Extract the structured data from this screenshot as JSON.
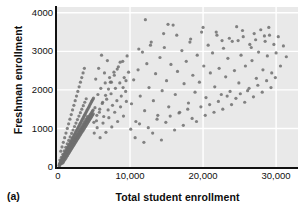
{
  "figure": {
    "panel_label": "(a)",
    "plot_background": "#e9e9e9",
    "gridline_color": "#ffffff",
    "point_color": "#6e6e6e",
    "axis_color": "#111111"
  },
  "chart_data": {
    "type": "scatter",
    "title": "",
    "xlabel": "Total student enrollment",
    "ylabel": "Freshman enrollment",
    "xlim": [
      0,
      33000
    ],
    "ylim": [
      0,
      4150
    ],
    "xticks": [
      0,
      10000,
      20000,
      30000
    ],
    "xticklabels": [
      "0",
      "10,000",
      "20,000",
      "30,000"
    ],
    "yticks": [
      0,
      1000,
      2000,
      3000,
      4000
    ],
    "yticklabels": [
      "0",
      "1000",
      "2000",
      "3000",
      "4000"
    ],
    "grid": true,
    "grid_axis": "both",
    "legend": "none",
    "marker": "dot",
    "marker_size": 1.6,
    "points": [
      [
        280,
        40
      ],
      [
        330,
        60
      ],
      [
        360,
        35
      ],
      [
        410,
        95
      ],
      [
        450,
        70
      ],
      [
        470,
        130
      ],
      [
        520,
        90
      ],
      [
        560,
        150
      ],
      [
        590,
        110
      ],
      [
        610,
        175
      ],
      [
        640,
        130
      ],
      [
        660,
        200
      ],
      [
        700,
        160
      ],
      [
        720,
        95
      ],
      [
        750,
        230
      ],
      [
        780,
        140
      ],
      [
        800,
        260
      ],
      [
        830,
        185
      ],
      [
        860,
        120
      ],
      [
        880,
        290
      ],
      [
        910,
        210
      ],
      [
        940,
        160
      ],
      [
        960,
        320
      ],
      [
        990,
        240
      ],
      [
        1010,
        180
      ],
      [
        1040,
        350
      ],
      [
        1070,
        270
      ],
      [
        1100,
        200
      ],
      [
        1120,
        380
      ],
      [
        1150,
        300
      ],
      [
        1180,
        230
      ],
      [
        1200,
        410
      ],
      [
        1230,
        330
      ],
      [
        1260,
        255
      ],
      [
        1290,
        440
      ],
      [
        1310,
        360
      ],
      [
        1340,
        280
      ],
      [
        1370,
        470
      ],
      [
        1400,
        390
      ],
      [
        1420,
        300
      ],
      [
        1450,
        500
      ],
      [
        1480,
        420
      ],
      [
        1510,
        330
      ],
      [
        1530,
        530
      ],
      [
        1560,
        450
      ],
      [
        1590,
        355
      ],
      [
        1620,
        560
      ],
      [
        1640,
        475
      ],
      [
        1670,
        380
      ],
      [
        1700,
        590
      ],
      [
        1730,
        500
      ],
      [
        1750,
        405
      ],
      [
        1780,
        620
      ],
      [
        1810,
        525
      ],
      [
        1840,
        430
      ],
      [
        1860,
        650
      ],
      [
        1890,
        550
      ],
      [
        1920,
        455
      ],
      [
        1950,
        680
      ],
      [
        1970,
        575
      ],
      [
        2000,
        480
      ],
      [
        2030,
        710
      ],
      [
        2060,
        600
      ],
      [
        2080,
        505
      ],
      [
        2110,
        740
      ],
      [
        2140,
        625
      ],
      [
        2170,
        530
      ],
      [
        2190,
        770
      ],
      [
        2220,
        650
      ],
      [
        2250,
        555
      ],
      [
        2280,
        800
      ],
      [
        2300,
        675
      ],
      [
        2330,
        580
      ],
      [
        2360,
        830
      ],
      [
        2390,
        700
      ],
      [
        2410,
        605
      ],
      [
        2440,
        860
      ],
      [
        2470,
        725
      ],
      [
        2500,
        630
      ],
      [
        2520,
        890
      ],
      [
        2550,
        750
      ],
      [
        2580,
        655
      ],
      [
        2610,
        920
      ],
      [
        2630,
        775
      ],
      [
        2660,
        680
      ],
      [
        2690,
        950
      ],
      [
        2720,
        800
      ],
      [
        2740,
        705
      ],
      [
        2770,
        980
      ],
      [
        2800,
        825
      ],
      [
        2830,
        730
      ],
      [
        2850,
        1010
      ],
      [
        2880,
        850
      ],
      [
        2910,
        755
      ],
      [
        2940,
        1040
      ],
      [
        2960,
        875
      ],
      [
        2990,
        780
      ],
      [
        3020,
        1070
      ],
      [
        3050,
        900
      ],
      [
        3070,
        805
      ],
      [
        3100,
        1100
      ],
      [
        3130,
        925
      ],
      [
        3160,
        830
      ],
      [
        3180,
        1130
      ],
      [
        3210,
        950
      ],
      [
        3240,
        855
      ],
      [
        3270,
        1160
      ],
      [
        3290,
        975
      ],
      [
        3320,
        880
      ],
      [
        3350,
        1190
      ],
      [
        3380,
        1000
      ],
      [
        3400,
        905
      ],
      [
        3430,
        1220
      ],
      [
        3460,
        1025
      ],
      [
        3490,
        930
      ],
      [
        3510,
        1250
      ],
      [
        3540,
        1050
      ],
      [
        3570,
        955
      ],
      [
        3600,
        1280
      ],
      [
        3620,
        1075
      ],
      [
        3650,
        980
      ],
      [
        3680,
        1310
      ],
      [
        3710,
        1100
      ],
      [
        3730,
        1005
      ],
      [
        3760,
        1340
      ],
      [
        3790,
        1125
      ],
      [
        3820,
        1030
      ],
      [
        3840,
        1370
      ],
      [
        3870,
        1150
      ],
      [
        3900,
        1055
      ],
      [
        3930,
        1400
      ],
      [
        3950,
        1175
      ],
      [
        3980,
        1080
      ],
      [
        4010,
        1430
      ],
      [
        4040,
        1200
      ],
      [
        4060,
        1105
      ],
      [
        4090,
        1460
      ],
      [
        4120,
        1225
      ],
      [
        4150,
        1130
      ],
      [
        4170,
        1490
      ],
      [
        4200,
        1250
      ],
      [
        4230,
        1155
      ],
      [
        4260,
        1520
      ],
      [
        4280,
        1275
      ],
      [
        4310,
        1180
      ],
      [
        4340,
        1550
      ],
      [
        4370,
        1300
      ],
      [
        4390,
        1205
      ],
      [
        4420,
        1580
      ],
      [
        4450,
        1325
      ],
      [
        4480,
        1230
      ],
      [
        4500,
        1610
      ],
      [
        4530,
        1350
      ],
      [
        4560,
        1255
      ],
      [
        4590,
        1640
      ],
      [
        4610,
        1375
      ],
      [
        4640,
        1280
      ],
      [
        4670,
        1670
      ],
      [
        4700,
        1400
      ],
      [
        4720,
        1305
      ],
      [
        4750,
        1700
      ],
      [
        4780,
        1425
      ],
      [
        4810,
        1330
      ],
      [
        4830,
        1730
      ],
      [
        4860,
        1450
      ],
      [
        4890,
        1355
      ],
      [
        4920,
        1760
      ],
      [
        4940,
        1475
      ],
      [
        4970,
        1380
      ],
      [
        5000,
        1790
      ],
      [
        520,
        410
      ],
      [
        690,
        520
      ],
      [
        870,
        640
      ],
      [
        1050,
        760
      ],
      [
        1230,
        880
      ],
      [
        1410,
        1000
      ],
      [
        1590,
        1120
      ],
      [
        1770,
        1240
      ],
      [
        1950,
        1360
      ],
      [
        2130,
        1480
      ],
      [
        2310,
        1600
      ],
      [
        2490,
        1720
      ],
      [
        2670,
        1840
      ],
      [
        2850,
        1960
      ],
      [
        3030,
        2080
      ],
      [
        3210,
        2200
      ],
      [
        3390,
        2320
      ],
      [
        3570,
        2440
      ],
      [
        3750,
        2560
      ],
      [
        400,
        180
      ],
      [
        600,
        250
      ],
      [
        800,
        330
      ],
      [
        1000,
        420
      ],
      [
        1200,
        510
      ],
      [
        1400,
        600
      ],
      [
        1600,
        690
      ],
      [
        1800,
        780
      ],
      [
        2000,
        870
      ],
      [
        2200,
        960
      ],
      [
        2400,
        1050
      ],
      [
        2600,
        1140
      ],
      [
        2800,
        1230
      ],
      [
        3000,
        1320
      ],
      [
        3200,
        1410
      ],
      [
        3400,
        1500
      ],
      [
        3600,
        1590
      ],
      [
        3800,
        1680
      ],
      [
        4000,
        1770
      ],
      [
        350,
        90
      ],
      [
        550,
        140
      ],
      [
        750,
        200
      ],
      [
        950,
        265
      ],
      [
        1150,
        330
      ],
      [
        1350,
        395
      ],
      [
        1550,
        460
      ],
      [
        1750,
        525
      ],
      [
        1950,
        590
      ],
      [
        2150,
        655
      ],
      [
        2350,
        720
      ],
      [
        2550,
        785
      ],
      [
        2750,
        850
      ],
      [
        2950,
        915
      ],
      [
        3150,
        980
      ],
      [
        3350,
        1045
      ],
      [
        3550,
        1110
      ],
      [
        3750,
        1175
      ],
      [
        3950,
        1240
      ],
      [
        4150,
        1305
      ],
      [
        5200,
        1540
      ],
      [
        5400,
        1200
      ],
      [
        5600,
        1880
      ],
      [
        5800,
        1420
      ],
      [
        6000,
        2040
      ],
      [
        6200,
        1650
      ],
      [
        6400,
        1310
      ],
      [
        6600,
        2180
      ],
      [
        6800,
        1760
      ],
      [
        7000,
        1480
      ],
      [
        7200,
        2320
      ],
      [
        7400,
        1900
      ],
      [
        7600,
        1600
      ],
      [
        7800,
        2460
      ],
      [
        8000,
        2040
      ],
      [
        8200,
        1720
      ],
      [
        8400,
        2600
      ],
      [
        8600,
        2180
      ],
      [
        8800,
        1840
      ],
      [
        9000,
        2740
      ],
      [
        9200,
        2320
      ],
      [
        9400,
        1960
      ],
      [
        9600,
        2880
      ],
      [
        9800,
        2460
      ],
      [
        5100,
        880
      ],
      [
        5500,
        1020
      ],
      [
        5900,
        760
      ],
      [
        6300,
        1140
      ],
      [
        6700,
        900
      ],
      [
        7100,
        1280
      ],
      [
        7500,
        1040
      ],
      [
        7900,
        1420
      ],
      [
        8300,
        1180
      ],
      [
        8700,
        1560
      ],
      [
        9100,
        1320
      ],
      [
        9500,
        1700
      ],
      [
        5300,
        2280
      ],
      [
        5700,
        2560
      ],
      [
        6100,
        2900
      ],
      [
        6500,
        2440
      ],
      [
        6900,
        2760
      ],
      [
        7300,
        2200
      ],
      [
        5050,
        1160
      ],
      [
        5450,
        1340
      ],
      [
        5850,
        1500
      ],
      [
        6250,
        1680
      ],
      [
        6650,
        1860
      ],
      [
        7050,
        2020
      ],
      [
        7450,
        2200
      ],
      [
        7850,
        2380
      ],
      [
        8250,
        2540
      ],
      [
        8650,
        2720
      ],
      [
        9050,
        2060
      ],
      [
        9450,
        2240
      ],
      [
        10200,
        1640
      ],
      [
        10500,
        2260
      ],
      [
        10800,
        1180
      ],
      [
        11100,
        2520
      ],
      [
        11400,
        1840
      ],
      [
        11700,
        2980
      ],
      [
        12000,
        1460
      ],
      [
        12300,
        2680
      ],
      [
        12600,
        2060
      ],
      [
        12900,
        3240
      ],
      [
        13200,
        1720
      ],
      [
        13500,
        2420
      ],
      [
        13800,
        1340
      ],
      [
        14100,
        2840
      ],
      [
        14400,
        1980
      ],
      [
        14700,
        3100
      ],
      [
        15000,
        2240
      ],
      [
        15300,
        1560
      ],
      [
        15600,
        2660
      ],
      [
        15900,
        3680
      ],
      [
        16200,
        1880
      ],
      [
        16500,
        2480
      ],
      [
        16800,
        1420
      ],
      [
        17100,
        3020
      ],
      [
        17400,
        2160
      ],
      [
        17700,
        2740
      ],
      [
        18000,
        1660
      ],
      [
        18300,
        3320
      ],
      [
        18600,
        2380
      ],
      [
        18900,
        1940
      ],
      [
        19200,
        2900
      ],
      [
        19500,
        2200
      ],
      [
        19800,
        3500
      ],
      [
        20100,
        2620
      ],
      [
        20400,
        1800
      ],
      [
        20700,
        3160
      ],
      [
        21000,
        2440
      ],
      [
        21300,
        2960
      ],
      [
        21600,
        2080
      ],
      [
        21900,
        3420
      ],
      [
        22200,
        2560
      ],
      [
        22500,
        1880
      ],
      [
        22800,
        3080
      ],
      [
        23100,
        2340
      ],
      [
        23400,
        2820
      ],
      [
        23700,
        1960
      ],
      [
        24000,
        3260
      ],
      [
        24300,
        2500
      ],
      [
        24600,
        3640
      ],
      [
        24900,
        2180
      ],
      [
        25200,
        2900
      ],
      [
        25500,
        3380
      ],
      [
        25800,
        2620
      ],
      [
        26100,
        1980
      ],
      [
        26400,
        3180
      ],
      [
        26700,
        2760
      ],
      [
        27000,
        3460
      ],
      [
        27300,
        2300
      ],
      [
        27600,
        2980
      ],
      [
        27900,
        3560
      ],
      [
        28200,
        2520
      ],
      [
        28500,
        3260
      ],
      [
        28800,
        2880
      ],
      [
        29100,
        3420
      ],
      [
        29400,
        2440
      ],
      [
        29700,
        3180
      ],
      [
        30000,
        2960
      ],
      [
        30300,
        3380
      ],
      [
        30600,
        2620
      ],
      [
        31000,
        3140
      ],
      [
        31400,
        2860
      ],
      [
        10100,
        980
      ],
      [
        10700,
        760
      ],
      [
        11300,
        1120
      ],
      [
        11900,
        640
      ],
      [
        12500,
        1020
      ],
      [
        13100,
        880
      ],
      [
        13700,
        1240
      ],
      [
        14300,
        700
      ],
      [
        14900,
        1160
      ],
      [
        15500,
        1320
      ],
      [
        16100,
        960
      ],
      [
        16700,
        1400
      ],
      [
        17300,
        1080
      ],
      [
        17900,
        1500
      ],
      [
        18500,
        1260
      ],
      [
        19100,
        1180
      ],
      [
        19700,
        1560
      ],
      [
        20300,
        1340
      ],
      [
        20900,
        1620
      ],
      [
        21500,
        1420
      ],
      [
        22100,
        1700
      ],
      [
        22700,
        1500
      ],
      [
        23300,
        1840
      ],
      [
        23900,
        1620
      ],
      [
        24500,
        1780
      ],
      [
        25100,
        1900
      ],
      [
        25700,
        1680
      ],
      [
        26300,
        2040
      ],
      [
        26900,
        1820
      ],
      [
        27500,
        2120
      ],
      [
        28100,
        1940
      ],
      [
        28700,
        2240
      ],
      [
        29300,
        2060
      ],
      [
        29900,
        2320
      ],
      [
        11200,
        3060
      ],
      [
        12800,
        3160
      ],
      [
        14600,
        3460
      ],
      [
        16400,
        3420
      ],
      [
        18200,
        3240
      ],
      [
        20000,
        3620
      ],
      [
        21800,
        3500
      ],
      [
        23600,
        3340
      ],
      [
        25400,
        3540
      ],
      [
        27200,
        3300
      ],
      [
        29000,
        3620
      ],
      [
        12100,
        3820
      ],
      [
        15200,
        3700
      ],
      [
        22600,
        3280
      ],
      [
        24800,
        3280
      ],
      [
        26600,
        3100
      ],
      [
        28400,
        3400
      ]
    ],
    "extra_points": []
  }
}
